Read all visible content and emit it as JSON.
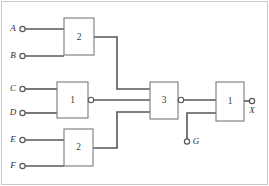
{
  "diagram": {
    "colors": {
      "wire": "#58585a",
      "gate_outline": "#7a7a7d",
      "frame": "#c9c9cb",
      "background": "#ffffff",
      "text": "#2e2e30"
    },
    "inputs": [
      {
        "id": "A",
        "label": "A",
        "x": 21,
        "y": 29
      },
      {
        "id": "B",
        "label": "B",
        "x": 21,
        "y": 56
      },
      {
        "id": "C",
        "label": "C",
        "x": 21,
        "y": 89
      },
      {
        "id": "D",
        "label": "D",
        "x": 21,
        "y": 113
      },
      {
        "id": "E",
        "label": "E",
        "x": 21,
        "y": 140
      },
      {
        "id": "F",
        "label": "F",
        "x": 21,
        "y": 166
      },
      {
        "id": "G",
        "label": "G",
        "x": 187,
        "y": 143
      }
    ],
    "outputs": [
      {
        "id": "X",
        "label": "X",
        "x": 254,
        "y": 101
      }
    ],
    "gates": [
      {
        "id": "g-top",
        "label": "2",
        "x": 64,
        "y": 18,
        "width": 30,
        "height": 37,
        "bubble": false
      },
      {
        "id": "g-mid",
        "label": "1",
        "x": 57,
        "y": 82,
        "width": 31,
        "height": 36,
        "bubble": true
      },
      {
        "id": "g-bottom",
        "label": "2",
        "x": 64,
        "y": 129,
        "width": 29,
        "height": 37,
        "bubble": false
      },
      {
        "id": "g-merge",
        "label": "3",
        "x": 150,
        "y": 82,
        "width": 28,
        "height": 37,
        "bubble": true
      },
      {
        "id": "g-final",
        "label": "1",
        "x": 216,
        "y": 82,
        "width": 28,
        "height": 39,
        "bubble": false
      }
    ],
    "gate_labels": {
      "top": "2",
      "middle": "1",
      "bottom": "2",
      "merge": "3",
      "final": "1"
    }
  }
}
